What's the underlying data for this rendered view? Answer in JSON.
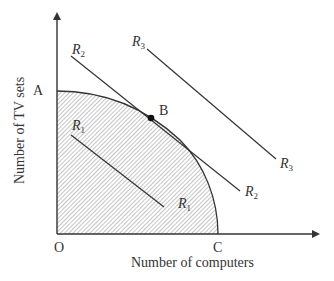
{
  "diagram": {
    "axes": {
      "x_label": "Number of computers",
      "y_label": "Number of TV sets",
      "origin_label": "O"
    },
    "points": {
      "A": "A",
      "B": "B",
      "C": "C"
    },
    "lines": [
      {
        "name": "R1",
        "base": "R",
        "sub": "1"
      },
      {
        "name": "R2",
        "base": "R",
        "sub": "2"
      },
      {
        "name": "R3",
        "base": "R",
        "sub": "3"
      }
    ],
    "colors": {
      "line": "#333333",
      "hatch": "#8a8a8a",
      "background": "#ffffff"
    }
  }
}
